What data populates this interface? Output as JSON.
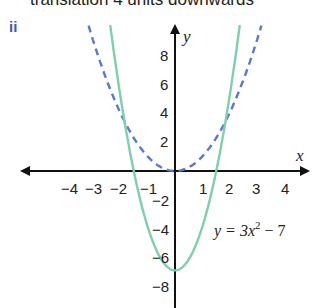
{
  "header": {
    "cut_text": "translation 4 units downwards",
    "part_label": "ii"
  },
  "chart_data": {
    "type": "line",
    "title": "",
    "xlabel": "x",
    "ylabel": "y",
    "xlim": [
      -4.5,
      4.5
    ],
    "ylim": [
      -9,
      10
    ],
    "grid": false,
    "x_ticks": [
      -4,
      -3,
      -2,
      -1,
      1,
      2,
      3,
      4
    ],
    "y_ticks": [
      -8,
      -6,
      -4,
      -2,
      2,
      4,
      6,
      8
    ],
    "x_tick_labels": [
      "−4",
      "−3",
      "−2",
      "−1",
      "1",
      "2",
      "3",
      "4"
    ],
    "y_tick_labels": [
      "−8",
      "−6",
      "−4",
      "−2",
      "2",
      "4",
      "6",
      "8"
    ],
    "series": [
      {
        "name": "y = x^2",
        "style": "dashed",
        "color": "#5b79c9",
        "x": [
          -3.2,
          -3,
          -2,
          -1,
          0,
          1,
          2,
          3,
          3.2
        ],
        "values": [
          10.24,
          9,
          4,
          1,
          0,
          1,
          4,
          9,
          10.24
        ]
      },
      {
        "name": "y = 3x^2 - 7",
        "style": "solid",
        "color": "#7fcfae",
        "x": [
          -2.4,
          -2,
          -1.5,
          -1,
          0,
          1,
          1.5,
          2,
          2.4
        ],
        "values": [
          10.28,
          5,
          -0.25,
          -4,
          -7,
          -4,
          -0.25,
          5,
          10.28
        ]
      }
    ],
    "annotations": [
      {
        "text_pre": "y = 3x",
        "sup": "2",
        "text_post": " − 7",
        "x": 1.3,
        "y": -4
      }
    ]
  },
  "labels": {
    "x_axis": "x",
    "y_axis": "y",
    "eq_pre": "y = 3x",
    "eq_sup": "2",
    "eq_post": " − 7",
    "ticks_x": [
      "−4",
      "−3",
      "−2",
      "−1",
      "1",
      "2",
      "3",
      "4"
    ],
    "ticks_y": [
      "8",
      "6",
      "4",
      "2",
      "−2",
      "−4",
      "−6",
      "−8"
    ]
  }
}
